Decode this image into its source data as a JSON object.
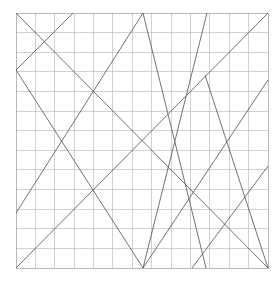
{
  "figure": {
    "title": "",
    "background_color": "#ffffff",
    "width": 280,
    "height": 282
  },
  "chart_data": {
    "type": "line",
    "title": "",
    "subtitle": "",
    "xlabel": "",
    "ylabel": "",
    "xlim": [
      0,
      13
    ],
    "ylim": [
      0,
      13
    ],
    "grid": true,
    "grid_color": "#b4b4b4",
    "legend": null,
    "legend_position": "none",
    "tick_labels_x": [],
    "tick_labels_y": [],
    "axis_ticks_visible": false,
    "plot_area_px": {
      "left": 16,
      "top": 13,
      "right": 268,
      "bottom": 268,
      "width": 252,
      "height": 255
    },
    "grid_divisions": {
      "x": 13,
      "y": 13
    },
    "line_color": "#59595e",
    "line_width": 0.85,
    "segments": [
      {
        "name": "segment-main-diagonal",
        "x1": 0.0,
        "y1": 13.0,
        "x2": 13.0,
        "y2": 0.0,
        "px": {
          "x1": 16,
          "y1": 13,
          "x2": 268,
          "y2": 268
        }
      },
      {
        "name": "segment-anti-diagonal-upper",
        "x1": 0.0,
        "y1": 0.0,
        "x2": 13.0,
        "y2": 13.0,
        "px": {
          "x1": 16,
          "y1": 268,
          "x2": 268,
          "y2": 13
        }
      },
      {
        "name": "segment-left-peak-descending",
        "x1": 0.0,
        "y1": 10.1,
        "x2": 6.55,
        "y2": 0.0,
        "px": {
          "x1": 16,
          "y1": 70,
          "x2": 143,
          "y2": 268
        }
      },
      {
        "name": "segment-left-edge-ascending",
        "x1": 0.0,
        "y1": 10.1,
        "x2": 2.95,
        "y2": 13.0,
        "px": {
          "x1": 16,
          "y1": 70,
          "x2": 73,
          "y2": 13
        }
      },
      {
        "name": "segment-apex-left-rise",
        "x1": 0.0,
        "y1": 2.9,
        "x2": 6.55,
        "y2": 13.0,
        "px": {
          "x1": 16,
          "y1": 213,
          "x2": 143,
          "y2": 13
        }
      },
      {
        "name": "segment-apex-right-fall",
        "x1": 6.55,
        "y1": 13.0,
        "x2": 9.8,
        "y2": 0.0,
        "px": {
          "x1": 143,
          "y1": 13,
          "x2": 206,
          "y2": 268
        }
      },
      {
        "name": "segment-bottom-vertex-steep-rise",
        "x1": 6.55,
        "y1": 0.0,
        "x2": 9.85,
        "y2": 13.0,
        "px": {
          "x1": 143,
          "y1": 268,
          "x2": 207,
          "y2": 13
        }
      },
      {
        "name": "segment-bottom-vertex-to-right-edge",
        "x1": 6.55,
        "y1": 0.0,
        "x2": 13.0,
        "y2": 9.6,
        "px": {
          "x1": 143,
          "y1": 268,
          "x2": 268,
          "y2": 80
        }
      },
      {
        "name": "segment-mid-right-crossing",
        "x1": 9.75,
        "y1": 9.85,
        "x2": 13.0,
        "y2": 0.0,
        "px": {
          "x1": 205,
          "y1": 75,
          "x2": 268,
          "y2": 268
        }
      },
      {
        "name": "segment-lower-right-rise",
        "x1": 9.1,
        "y1": 0.0,
        "x2": 13.0,
        "y2": 5.2,
        "px": {
          "x1": 192,
          "y1": 268,
          "x2": 268,
          "y2": 166
        }
      }
    ]
  }
}
